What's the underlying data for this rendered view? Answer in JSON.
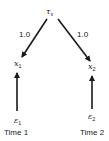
{
  "diagram": {
    "nodes": {
      "latent": {
        "symbol": "τ",
        "subscript": "x"
      },
      "x1": {
        "symbol": "x",
        "subscript": "1"
      },
      "x2": {
        "symbol": "x",
        "subscript": "2"
      },
      "e1": {
        "symbol": "ε",
        "subscript": "1"
      },
      "e2": {
        "symbol": "ε",
        "subscript": "2"
      }
    },
    "edges": [
      {
        "from": "latent",
        "to": "x1",
        "label": "1.0"
      },
      {
        "from": "latent",
        "to": "x2",
        "label": "1.0"
      },
      {
        "from": "e1",
        "to": "x1",
        "label": ""
      },
      {
        "from": "e2",
        "to": "x2",
        "label": ""
      }
    ],
    "time_labels": [
      "Time 1",
      "Time 2"
    ],
    "colors": {
      "stroke": "#1a1a1a",
      "background": "#ffffff"
    }
  }
}
